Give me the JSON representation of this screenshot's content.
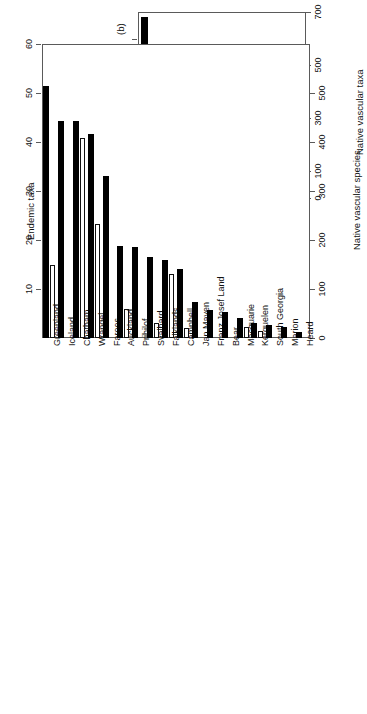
{
  "figure": {
    "panel_a_label": "",
    "panel_b_label": "(b)",
    "orientation_note": "rotated"
  },
  "chart_data": [
    {
      "id": "panel_a",
      "type": "bar",
      "title": "",
      "panel_label": "",
      "xlabel": "",
      "ylabel": "Arctic endemic taxa",
      "y2label": "Native vascular taxa",
      "categories": [
        "Norway",
        "Greenland",
        "Iceland",
        "Wrangel",
        "Faroes",
        "Svalbard",
        "Jan Mayen",
        "Franz Josef Land"
      ],
      "yticks": [
        0,
        10,
        30,
        50
      ],
      "yticks_minor": [
        20,
        40,
        60
      ],
      "ylim": [
        0,
        70
      ],
      "y2ticks": [
        0,
        100,
        300,
        500,
        700
      ],
      "y2lim": [
        0,
        700
      ],
      "grid": false,
      "legend_position": "none",
      "series": [
        {
          "name": "Arctic endemic taxa",
          "style": "solid",
          "axis": "left",
          "values": [
            68.0,
            46.0,
            40.0,
            29.5,
            27.0,
            17.0,
            7.5,
            6.0
          ]
        },
        {
          "name": "Native vascular taxa",
          "style": "open",
          "axis": "right",
          "values": [
            92,
            33,
            10,
            308,
            12,
            168,
            14,
            85
          ]
        }
      ]
    },
    {
      "id": "panel_b",
      "type": "bar",
      "title": "",
      "panel_label": "(b)",
      "xlabel": "",
      "ylabel": "Endemic taxa",
      "y2label": "Native vascular species",
      "categories": [
        "Greenland",
        "Iceland",
        "Chatham",
        "Wrangel",
        "Faroes",
        "Auckland",
        "Pribilof",
        "Svalbard",
        "Falklands",
        "Campbell",
        "Jan Mayen",
        "Franz Josef Land",
        "Bear",
        "Macquarie",
        "Kerguelen",
        "South Georgia",
        "Marion",
        "Heard"
      ],
      "yticks": [
        10,
        20,
        30,
        40,
        50,
        60
      ],
      "ylim": [
        0,
        60
      ],
      "y2ticks": [
        0,
        100,
        200,
        300,
        400,
        500
      ],
      "y2lim": [
        0,
        600
      ],
      "grid": false,
      "legend_position": "none",
      "series": [
        {
          "name": "Endemic taxa",
          "style": "solid",
          "axis": "left",
          "values": [
            51.5,
            44.3,
            44.2,
            41.7,
            33.0,
            18.8,
            18.5,
            16.5,
            16.0,
            14.0,
            7.3,
            5.7,
            5.4,
            4.0,
            3.1,
            2.6,
            2.2,
            1.2
          ]
        },
        {
          "name": "Native vascular species",
          "style": "open",
          "axis": "right",
          "values": [
            150,
            0,
            408,
            232,
            0,
            60,
            0,
            30,
            131,
            21,
            0,
            0,
            0,
            22,
            14,
            0,
            0,
            0
          ]
        }
      ]
    }
  ]
}
